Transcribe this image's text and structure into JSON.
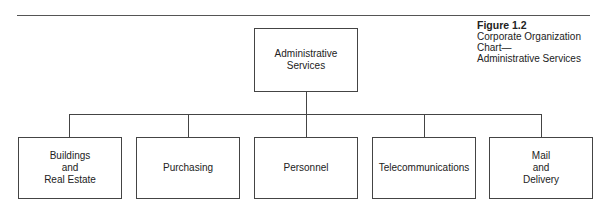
{
  "figure": {
    "number": "Figure 1.2",
    "caption": "Corporate Organization Chart—\nAdministrative Services"
  },
  "root": {
    "label": "Administrative\nServices"
  },
  "children": [
    {
      "label": "Buildings\nand\nReal Estate"
    },
    {
      "label": "Purchasing"
    },
    {
      "label": "Personnel"
    },
    {
      "label": "Telecommunications"
    },
    {
      "label": "Mail\nand\nDelivery"
    }
  ],
  "colors": {
    "line": "#444444",
    "text": "#222222",
    "background": "#ffffff"
  }
}
